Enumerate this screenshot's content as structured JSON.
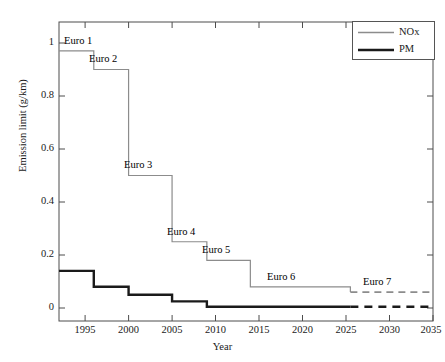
{
  "chart_data": {
    "type": "line",
    "title": "",
    "xlabel": "Year",
    "ylabel": "Emission limit (g/km)",
    "xlim": [
      1992,
      2035
    ],
    "ylim": [
      -0.05,
      1.1
    ],
    "xticks": [
      1995,
      2000,
      2005,
      2010,
      2015,
      2020,
      2025,
      2030,
      2035
    ],
    "xticklabels": [
      "1995",
      "2000",
      "2005",
      "2010",
      "2015",
      "2020",
      "2025",
      "2030",
      "2035"
    ],
    "yticks": [
      0,
      0.2,
      0.4,
      0.6,
      0.8,
      1
    ],
    "yticklabels": [
      "0",
      "0.2",
      "0.4",
      "0.6",
      "0.8",
      "1"
    ],
    "grid": false,
    "legend_position": "upper right",
    "drawstyle": "steps-post",
    "series": [
      {
        "name": "NOx",
        "color": "#8c8c8c",
        "linewidth": 1.2,
        "x": [
          1992,
          1996,
          2000,
          2005,
          2009,
          2014,
          2025.5,
          2035
        ],
        "values": [
          0.97,
          0.9,
          0.5,
          0.25,
          0.18,
          0.08,
          0.06,
          0.06
        ],
        "dashed_from_x": 2025.5,
        "dashed_values": [
          0.06,
          0.06
        ]
      },
      {
        "name": "PM",
        "color": "#1a1a1a",
        "linewidth": 2.4,
        "x": [
          1992,
          1996,
          2000,
          2005,
          2009,
          2025.5,
          2035
        ],
        "values": [
          0.14,
          0.08,
          0.05,
          0.025,
          0.0045,
          0.0045,
          0.0045
        ],
        "dashed_from_x": 2025.5,
        "dashed_values": [
          0.0045,
          0.0045
        ]
      }
    ],
    "annotations": [
      {
        "text": "Euro 1",
        "x": 1992.6,
        "y": 1.005
      },
      {
        "text": "Euro 2",
        "x": 1996.6,
        "y": 0.935
      },
      {
        "text": "Euro 3",
        "x": 2000.6,
        "y": 0.535
      },
      {
        "text": "Euro 4",
        "x": 2005.6,
        "y": 0.285
      },
      {
        "text": "Euro 5",
        "x": 2009.6,
        "y": 0.215
      },
      {
        "text": "Euro 6",
        "x": 2016.3,
        "y": 0.115
      },
      {
        "text": "Euro 7",
        "x": 2027.6,
        "y": 0.095
      }
    ],
    "legend_entries": [
      {
        "label": "NOx",
        "color": "#8c8c8c",
        "linewidth": 1.2
      },
      {
        "label": "PM",
        "color": "#1a1a1a",
        "linewidth": 2.4
      }
    ]
  },
  "axes": {
    "ylabel": "Emission limit (g/km)",
    "xlabel": "Year"
  },
  "ytick_labels": {
    "t0": "0",
    "t1": "0.2",
    "t2": "0.4",
    "t3": "0.6",
    "t4": "0.8",
    "t5": "1"
  },
  "xtick_labels": {
    "t0": "1995",
    "t1": "2000",
    "t2": "2005",
    "t3": "2010",
    "t4": "2015",
    "t5": "2020",
    "t6": "2025",
    "t7": "2030",
    "t8": "2035"
  },
  "annotation_labels": {
    "euro1": "Euro 1",
    "euro2": "Euro 2",
    "euro3": "Euro 3",
    "euro4": "Euro 4",
    "euro5": "Euro 5",
    "euro6": "Euro 6",
    "euro7": "Euro 7"
  },
  "legend": {
    "nox": "NOx",
    "pm": "PM"
  },
  "colors": {
    "nox": "#8c8c8c",
    "pm": "#1a1a1a",
    "axis": "#4d4d4d",
    "background": "#ffffff"
  }
}
